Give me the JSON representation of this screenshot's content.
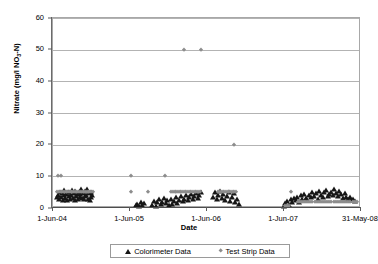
{
  "chart_data": {
    "type": "scatter",
    "title": "",
    "xlabel": "Date",
    "ylabel": "Nitrate (mg/l NO3-N)",
    "ylabel_main": "Nitrate (mg/l NO",
    "ylabel_sub": "3",
    "ylabel_tail": "-N)",
    "grid": true,
    "legend_position": "bottom",
    "ylim": [
      0,
      60
    ],
    "yticks": [
      0,
      10,
      20,
      30,
      40,
      50,
      60
    ],
    "ytick_labels": [
      "0",
      "10",
      "20",
      "30",
      "40",
      "50",
      "60"
    ],
    "xlim": [
      0,
      1460
    ],
    "xticks": [
      0,
      365,
      730,
      1095,
      1460
    ],
    "xtick_labels": [
      "1-Jun-04",
      "1-Jun-05",
      "1-Jun-06",
      "1-Jun-07",
      "31-May-08"
    ],
    "series": [
      {
        "name": "Colorimeter Data",
        "marker": "triangle",
        "color": "#161616",
        "points": [
          [
            20,
            3.4
          ],
          [
            26,
            4.2
          ],
          [
            30,
            2.9
          ],
          [
            34,
            5.1
          ],
          [
            38,
            3.6
          ],
          [
            42,
            4.6
          ],
          [
            46,
            2.6
          ],
          [
            50,
            4.0
          ],
          [
            54,
            5.6
          ],
          [
            58,
            3.1
          ],
          [
            62,
            4.4
          ],
          [
            66,
            2.4
          ],
          [
            70,
            5.2
          ],
          [
            74,
            3.8
          ],
          [
            78,
            4.9
          ],
          [
            82,
            2.8
          ],
          [
            86,
            4.1
          ],
          [
            90,
            5.8
          ],
          [
            94,
            3.3
          ],
          [
            98,
            4.7
          ],
          [
            102,
            2.5
          ],
          [
            106,
            5.3
          ],
          [
            110,
            3.9
          ],
          [
            114,
            4.3
          ],
          [
            118,
            2.7
          ],
          [
            122,
            5.0
          ],
          [
            126,
            3.5
          ],
          [
            130,
            4.5
          ],
          [
            134,
            6.0
          ],
          [
            138,
            3.2
          ],
          [
            142,
            4.8
          ],
          [
            146,
            2.9
          ],
          [
            150,
            5.4
          ],
          [
            154,
            3.7
          ],
          [
            158,
            4.2
          ],
          [
            162,
            5.9
          ],
          [
            166,
            3.0
          ],
          [
            170,
            4.6
          ],
          [
            174,
            2.6
          ],
          [
            178,
            5.1
          ],
          [
            182,
            3.4
          ],
          [
            186,
            4.0
          ],
          [
            392,
            0.8
          ],
          [
            400,
            1.3
          ],
          [
            408,
            0.6
          ],
          [
            416,
            1.9
          ],
          [
            424,
            0.9
          ],
          [
            432,
            1.5
          ],
          [
            470,
            1.1
          ],
          [
            478,
            2.3
          ],
          [
            486,
            0.7
          ],
          [
            494,
            1.8
          ],
          [
            502,
            2.8
          ],
          [
            510,
            1.2
          ],
          [
            518,
            2.0
          ],
          [
            526,
            3.1
          ],
          [
            534,
            1.6
          ],
          [
            542,
            2.5
          ],
          [
            550,
            1.0
          ],
          [
            558,
            2.9
          ],
          [
            566,
            1.4
          ],
          [
            574,
            2.2
          ],
          [
            582,
            3.4
          ],
          [
            590,
            1.7
          ],
          [
            598,
            2.6
          ],
          [
            606,
            3.8
          ],
          [
            614,
            2.1
          ],
          [
            622,
            3.0
          ],
          [
            630,
            4.1
          ],
          [
            638,
            2.4
          ],
          [
            646,
            3.5
          ],
          [
            654,
            4.4
          ],
          [
            662,
            2.7
          ],
          [
            670,
            3.9
          ],
          [
            678,
            4.8
          ],
          [
            686,
            3.2
          ],
          [
            694,
            4.2
          ],
          [
            702,
            5.0
          ],
          [
            760,
            3.6
          ],
          [
            768,
            4.9
          ],
          [
            776,
            2.8
          ],
          [
            784,
            4.1
          ],
          [
            792,
            5.3
          ],
          [
            800,
            3.3
          ],
          [
            808,
            4.5
          ],
          [
            816,
            2.5
          ],
          [
            824,
            3.8
          ],
          [
            832,
            5.1
          ],
          [
            840,
            2.2
          ],
          [
            848,
            3.4
          ],
          [
            856,
            4.6
          ],
          [
            864,
            1.9
          ],
          [
            872,
            2.7
          ],
          [
            880,
            1.4
          ],
          [
            1095,
            0.7
          ],
          [
            1102,
            1.5
          ],
          [
            1110,
            2.2
          ],
          [
            1118,
            1.1
          ],
          [
            1126,
            2.8
          ],
          [
            1134,
            1.9
          ],
          [
            1142,
            3.1
          ],
          [
            1150,
            2.4
          ],
          [
            1158,
            3.6
          ],
          [
            1166,
            2.0
          ],
          [
            1174,
            4.0
          ],
          [
            1182,
            2.9
          ],
          [
            1190,
            4.5
          ],
          [
            1198,
            3.2
          ],
          [
            1206,
            2.5
          ],
          [
            1214,
            4.2
          ],
          [
            1222,
            3.4
          ],
          [
            1230,
            5.0
          ],
          [
            1238,
            3.8
          ],
          [
            1246,
            4.7
          ],
          [
            1254,
            3.0
          ],
          [
            1262,
            5.4
          ],
          [
            1270,
            4.1
          ],
          [
            1278,
            3.5
          ],
          [
            1286,
            4.9
          ],
          [
            1294,
            5.7
          ],
          [
            1302,
            3.9
          ],
          [
            1310,
            4.4
          ],
          [
            1318,
            5.2
          ],
          [
            1326,
            4.0
          ],
          [
            1334,
            5.9
          ],
          [
            1342,
            4.6
          ],
          [
            1350,
            3.7
          ],
          [
            1358,
            5.5
          ],
          [
            1366,
            4.3
          ],
          [
            1374,
            3.2
          ],
          [
            1382,
            4.8
          ],
          [
            1390,
            3.6
          ],
          [
            1398,
            2.8
          ],
          [
            1406,
            3.4
          ],
          [
            1414,
            2.6
          ],
          [
            1422,
            3.0
          ],
          [
            1430,
            2.3
          ]
        ]
      },
      {
        "name": "Test Strip Data",
        "marker": "diamond",
        "color": "#8d8d8d",
        "points": [
          [
            22,
            10
          ],
          [
            36,
            10
          ],
          [
            20,
            5
          ],
          [
            28,
            5
          ],
          [
            36,
            5
          ],
          [
            44,
            5
          ],
          [
            52,
            5
          ],
          [
            60,
            5
          ],
          [
            68,
            5
          ],
          [
            76,
            5
          ],
          [
            84,
            5
          ],
          [
            92,
            5
          ],
          [
            100,
            5
          ],
          [
            108,
            5
          ],
          [
            116,
            5
          ],
          [
            124,
            5
          ],
          [
            132,
            5
          ],
          [
            140,
            5
          ],
          [
            148,
            5
          ],
          [
            156,
            5
          ],
          [
            164,
            5
          ],
          [
            172,
            5
          ],
          [
            180,
            5
          ],
          [
            188,
            5
          ],
          [
            370,
            10
          ],
          [
            372,
            5
          ],
          [
            448,
            5
          ],
          [
            530,
            10
          ],
          [
            620,
            50
          ],
          [
            700,
            50
          ],
          [
            860,
            20
          ],
          [
            560,
            5
          ],
          [
            568,
            5
          ],
          [
            576,
            5
          ],
          [
            584,
            5
          ],
          [
            592,
            5
          ],
          [
            600,
            5
          ],
          [
            608,
            5
          ],
          [
            616,
            5
          ],
          [
            624,
            5
          ],
          [
            632,
            5
          ],
          [
            640,
            5
          ],
          [
            648,
            5
          ],
          [
            656,
            5
          ],
          [
            664,
            5
          ],
          [
            672,
            5
          ],
          [
            680,
            5
          ],
          [
            688,
            5
          ],
          [
            696,
            5
          ],
          [
            780,
            5
          ],
          [
            788,
            5
          ],
          [
            796,
            5
          ],
          [
            804,
            5
          ],
          [
            812,
            5
          ],
          [
            820,
            5
          ],
          [
            828,
            5
          ],
          [
            836,
            5
          ],
          [
            844,
            5
          ],
          [
            852,
            5
          ],
          [
            860,
            5
          ],
          [
            868,
            5
          ],
          [
            1130,
            5
          ],
          [
            1160,
            2
          ],
          [
            1170,
            2
          ],
          [
            1180,
            2
          ],
          [
            1190,
            2
          ],
          [
            1200,
            2
          ],
          [
            1210,
            2
          ],
          [
            1220,
            2
          ],
          [
            1230,
            2
          ],
          [
            1240,
            2
          ],
          [
            1250,
            2
          ],
          [
            1260,
            2
          ],
          [
            1270,
            2
          ],
          [
            1280,
            2
          ],
          [
            1290,
            2
          ],
          [
            1300,
            2
          ],
          [
            1310,
            2
          ],
          [
            1320,
            2
          ],
          [
            1330,
            2
          ],
          [
            1340,
            2
          ],
          [
            1350,
            2
          ],
          [
            1360,
            2
          ],
          [
            1370,
            2
          ],
          [
            1380,
            2
          ],
          [
            1390,
            2
          ],
          [
            1400,
            2
          ],
          [
            1410,
            2
          ],
          [
            1420,
            2
          ],
          [
            1430,
            2
          ],
          [
            1440,
            2
          ],
          [
            1100,
            0.5
          ],
          [
            1110,
            0.6
          ],
          [
            1120,
            0.6
          ]
        ]
      }
    ]
  },
  "legend": {
    "entries": [
      {
        "label": "Colorimeter Data",
        "marker": "triangle"
      },
      {
        "label": "Test Strip Data",
        "marker": "diamond"
      }
    ]
  }
}
